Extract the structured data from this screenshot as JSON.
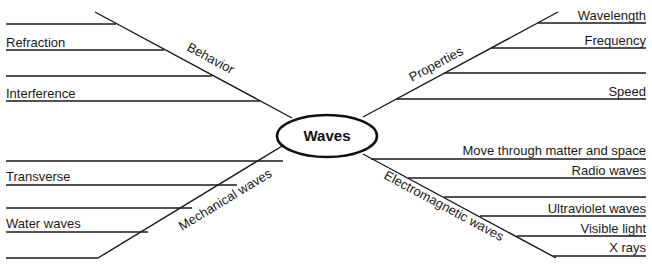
{
  "center": {
    "label": "Waves"
  },
  "branches": {
    "behavior": {
      "label": "Behavior",
      "items": [
        "",
        "Refraction",
        "",
        "Interference"
      ]
    },
    "properties": {
      "label": "Properties",
      "items": [
        "Wavelength",
        "Frequency",
        "",
        "Speed"
      ]
    },
    "mechanical": {
      "label": "Mechanical waves",
      "items": [
        "",
        "Transverse",
        "",
        "Water waves",
        ""
      ]
    },
    "electromagnetic": {
      "label": "Electromagnetic waves",
      "items": [
        "Move through matter and space",
        "Radio waves",
        "",
        "Ultraviolet waves",
        "Visible light",
        "X rays"
      ]
    }
  }
}
